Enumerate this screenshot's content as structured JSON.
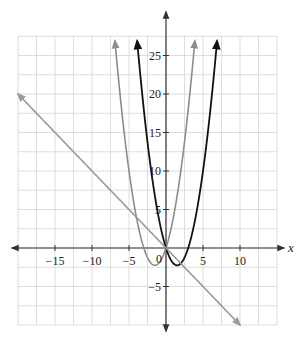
{
  "chart_data": {
    "type": "line",
    "title": "",
    "xlabel": "x",
    "ylabel": "",
    "xlim": [
      -20,
      15
    ],
    "ylim": [
      -10,
      27.5
    ],
    "grid": true,
    "grid_step": 2.5,
    "x_ticks": [
      -15,
      -10,
      -5,
      5,
      10
    ],
    "x_tick_labels": [
      "−15",
      "−10",
      "−5",
      "5",
      "10"
    ],
    "y_ticks": [
      25,
      20,
      15,
      10,
      5,
      -5
    ],
    "y_tick_labels": [
      "25",
      "20",
      "15",
      "10",
      "5",
      "−5"
    ],
    "origin_label": "0",
    "series": [
      {
        "name": "y = x^2 + 3x",
        "color": "#8c8c8c",
        "width": 1.6,
        "expression": "x*x + 3*x",
        "x_range": [
          -6.9,
          3.9
        ],
        "arrows": "both",
        "points": [
          [
            -6.9,
            26.9
          ],
          [
            -6,
            18
          ],
          [
            -5,
            10
          ],
          [
            -4,
            4
          ],
          [
            -3,
            0
          ],
          [
            -2,
            -2
          ],
          [
            -1.5,
            -2.25
          ],
          [
            -1,
            -2
          ],
          [
            0,
            0
          ],
          [
            1,
            4
          ],
          [
            2,
            10
          ],
          [
            3,
            18
          ],
          [
            3.9,
            26.9
          ]
        ]
      },
      {
        "name": "y = x^2 - 3x",
        "color": "#111111",
        "width": 1.8,
        "expression": "x*x - 3*x",
        "x_range": [
          -3.9,
          6.9
        ],
        "arrows": "both",
        "points": [
          [
            -3.9,
            26.9
          ],
          [
            -3,
            18
          ],
          [
            -2,
            10
          ],
          [
            -1,
            4
          ],
          [
            0,
            0
          ],
          [
            1,
            -2
          ],
          [
            1.5,
            -2.25
          ],
          [
            2,
            -2
          ],
          [
            3,
            0
          ],
          [
            4,
            4
          ],
          [
            5,
            10
          ],
          [
            6,
            18
          ],
          [
            6.9,
            26.9
          ]
        ]
      },
      {
        "name": "y = -x",
        "color": "#9a9a9a",
        "width": 1.6,
        "expression": "-x",
        "x_range": [
          -20,
          10
        ],
        "arrows": "both",
        "points": [
          [
            -20,
            20
          ],
          [
            0,
            0
          ],
          [
            10,
            -10
          ]
        ]
      }
    ]
  },
  "layout": {
    "x0_px": 166,
    "y0_px": 248,
    "px_per_x": 7.4,
    "px_per_y": 7.7,
    "x_axis_px": [
      12,
      284
    ],
    "y_axis_px": [
      12,
      331
    ],
    "grid_color": "#d6d6d6",
    "axis_color": "#333333"
  }
}
